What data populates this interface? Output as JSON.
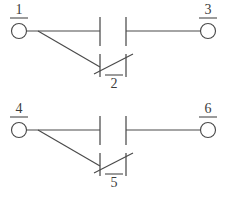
{
  "diagram": {
    "type": "electrical-schematic",
    "colors": {
      "line": "#4a4a4a",
      "background": "#ffffff",
      "label_text": "#3c3c3c"
    },
    "circuits": [
      {
        "id": "circuit-top",
        "name": "contact-set-1-2-3",
        "terminals": [
          {
            "id": "terminal-1",
            "label": "1",
            "rule": "underline",
            "position": "left",
            "cx": 19,
            "cy": 31,
            "r": 7.5,
            "label_x": 19,
            "label_y": 14,
            "rule_x1": 10,
            "rule_x2": 28,
            "rule_y": 18
          },
          {
            "id": "terminal-3",
            "label": "3",
            "rule": "underline",
            "position": "right",
            "cx": 208,
            "cy": 31,
            "r": 7.5,
            "label_x": 208,
            "label_y": 14,
            "rule_x1": 199,
            "rule_x2": 217,
            "rule_y": 18
          },
          {
            "id": "terminal-2",
            "label": "2",
            "rule": "overline",
            "position": "bottom-center",
            "label_x": 114,
            "label_y": 88,
            "rule_x1": 105,
            "rule_x2": 123,
            "rule_y": 75
          }
        ],
        "wires": [
          {
            "id": "wire-1-to-gap",
            "d": "M 26.5 31 L 100 31"
          },
          {
            "id": "wire-gap-to-3",
            "d": "M 126 31 L 200.5 31"
          },
          {
            "id": "wire-branch-1-to-2",
            "d": "M 38 31 L 100 67"
          }
        ],
        "contacts": [
          {
            "id": "contact-upper-open",
            "kind": "normally-open",
            "bar_left": {
              "x": 100,
              "y1": 17,
              "y2": 46
            },
            "bar_right": {
              "x": 126,
              "y1": 17,
              "y2": 46
            }
          },
          {
            "id": "contact-lower-transfer",
            "kind": "transfer-slash",
            "bar_left": {
              "x": 100,
              "y1": 54,
              "y2": 77
            },
            "bar_right": {
              "x": 126,
              "y1": 54,
              "y2": 77
            },
            "slash": {
              "x1": 94,
              "y1": 74,
              "x2": 133,
              "y2": 54
            }
          }
        ]
      },
      {
        "id": "circuit-bottom",
        "name": "contact-set-4-5-6",
        "terminals": [
          {
            "id": "terminal-4",
            "label": "4",
            "rule": "underline",
            "position": "left",
            "cx": 19,
            "cy": 130,
            "r": 7.5,
            "label_x": 19,
            "label_y": 113,
            "rule_x1": 10,
            "rule_x2": 28,
            "rule_y": 117
          },
          {
            "id": "terminal-6",
            "label": "6",
            "rule": "underline",
            "position": "right",
            "cx": 208,
            "cy": 130,
            "r": 7.5,
            "label_x": 208,
            "label_y": 113,
            "rule_x1": 199,
            "rule_x2": 217,
            "rule_y": 117
          },
          {
            "id": "terminal-5",
            "label": "5",
            "rule": "overline",
            "position": "bottom-center",
            "label_x": 114,
            "label_y": 187,
            "rule_x1": 105,
            "rule_x2": 123,
            "rule_y": 174
          }
        ],
        "wires": [
          {
            "id": "wire-4-to-gap",
            "d": "M 26.5 130 L 100 130"
          },
          {
            "id": "wire-gap-to-6",
            "d": "M 126 130 L 200.5 130"
          },
          {
            "id": "wire-branch-4-to-5",
            "d": "M 38 130 L 100 166"
          }
        ],
        "contacts": [
          {
            "id": "contact-upper-open",
            "kind": "normally-open",
            "bar_left": {
              "x": 100,
              "y1": 116,
              "y2": 145
            },
            "bar_right": {
              "x": 126,
              "y1": 116,
              "y2": 145
            }
          },
          {
            "id": "contact-lower-transfer",
            "kind": "transfer-slash",
            "bar_left": {
              "x": 100,
              "y1": 153,
              "y2": 176
            },
            "bar_right": {
              "x": 126,
              "y1": 153,
              "y2": 176
            },
            "slash": {
              "x1": 94,
              "y1": 173,
              "x2": 133,
              "y2": 153
            }
          }
        ]
      }
    ]
  }
}
